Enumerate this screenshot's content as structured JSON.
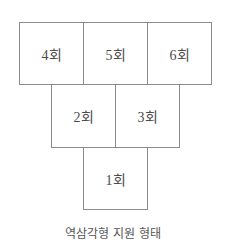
{
  "diagram": {
    "title": "역삼각형 지원 형태",
    "rows": [
      {
        "boxes": [
          {
            "label": "4회"
          },
          {
            "label": "5회"
          },
          {
            "label": "6회"
          }
        ]
      },
      {
        "boxes": [
          {
            "label": "2회"
          },
          {
            "label": "3회"
          }
        ]
      },
      {
        "boxes": [
          {
            "label": "1회"
          }
        ]
      }
    ]
  }
}
